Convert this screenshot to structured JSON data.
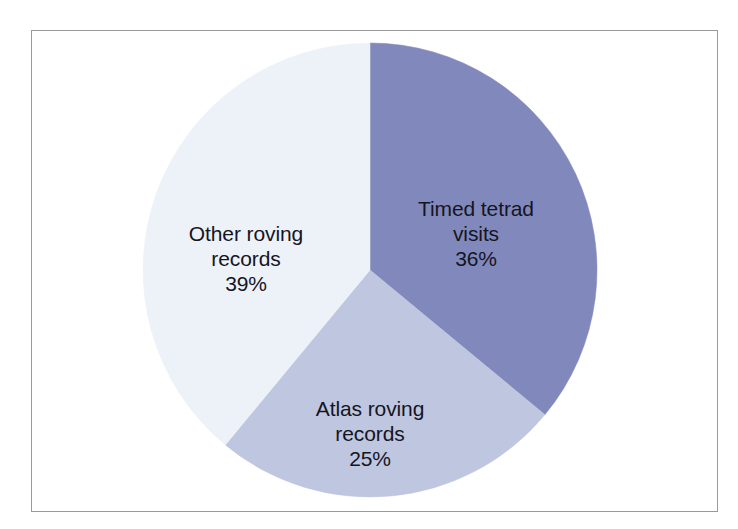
{
  "figure": {
    "background_color": "#ffffff",
    "frame_color": "#9a9a9a",
    "label_text_color": "#15151f"
  },
  "chart_data": {
    "type": "pie",
    "title": "",
    "subtitle": "",
    "xlabel": "",
    "ylabel": "",
    "legend_position": "none",
    "grid": false,
    "labels_inside_slices": true,
    "start_angle_deg": 0,
    "direction": "clockwise",
    "categories": [
      "Timed tetrad visits",
      "Atlas roving records",
      "Other roving records"
    ],
    "values": [
      36,
      25,
      39
    ],
    "value_suffix": "%",
    "colors": [
      "#8189bc",
      "#bfc6df",
      "#edf2f8"
    ],
    "slices": [
      {
        "name": "Timed tetrad visits",
        "label_line_1": "Timed tetrad",
        "label_line_2": "visits",
        "value": 36,
        "value_label": "36%",
        "color": "#8189bc"
      },
      {
        "name": "Atlas roving records",
        "label_line_1": "Atlas roving",
        "label_line_2": "records",
        "value": 25,
        "value_label": "25%",
        "color": "#bfc6df"
      },
      {
        "name": "Other roving records",
        "label_line_1": "Other roving",
        "label_line_2": "records",
        "value": 39,
        "value_label": "39%",
        "color": "#edf2f8"
      }
    ]
  }
}
